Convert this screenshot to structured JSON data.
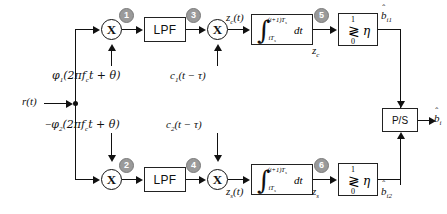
{
  "diagram": {
    "type": "signal-processing-block-diagram",
    "input_label": "r(t)",
    "blocks": {
      "lpf_upper": "LPF",
      "lpf_lower": "LPF",
      "ps": "P/S",
      "integrator_label": "dt",
      "integrator_sign": "∫",
      "integrator_upper_limit": "(i+1)T",
      "integrator_upper_limit_sub": "s",
      "integrator_lower_limit": "iT",
      "integrator_lower_limit_sub": "s",
      "comparator_high": "1",
      "comparator_symbol": "≷",
      "comparator_threshold": "η",
      "comparator_low": "0",
      "multiplier_symbol": "X"
    },
    "stage_numbers": [
      "1",
      "2",
      "3",
      "4",
      "5",
      "6"
    ],
    "carrier_upper": {
      "fn": "φ",
      "fn_sub": "1",
      "arg": "(2πf",
      "arg_sub": "c",
      "arg_rest": "t + θ)"
    },
    "carrier_lower": {
      "sign": "−",
      "fn": "φ",
      "fn_sub": "2",
      "arg": "(2πf",
      "arg_sub": "c",
      "arg_rest": "t + θ)"
    },
    "code_upper": {
      "fn": "c",
      "fn_sub": "1",
      "arg": "(t − τ)"
    },
    "code_lower": {
      "fn": "c",
      "fn_sub": "2",
      "arg": "(t − τ)"
    },
    "signals": {
      "zc_t": "z",
      "zc_t_sub": "c",
      "zc_t_arg": "(t)",
      "zs_t": "z",
      "zs_t_sub": "s",
      "zs_t_arg": "(t)",
      "zc": "z",
      "zc_sub": "c",
      "zs": "z",
      "zs_sub": "s"
    },
    "outputs": {
      "b_i1": "b",
      "b_i1_sub": "i1",
      "b_i2": "b",
      "b_i2_sub": "i2",
      "b_i": "b",
      "b_i_sub": "i",
      "hat": "ˆ"
    },
    "colors": {
      "line": "#111111",
      "block_border": "#222222",
      "stage_circle_fill": "#9a9a9a",
      "stage_circle_text": "#ffffff",
      "background": "#ffffff"
    }
  }
}
